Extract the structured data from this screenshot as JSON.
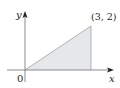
{
  "diagram": {
    "type": "shaded-triangle-region",
    "axes": {
      "x_label": "x",
      "y_label": "y",
      "origin_label": "0"
    },
    "vertices": [
      [
        0,
        0
      ],
      [
        3,
        0
      ],
      [
        3,
        2
      ]
    ],
    "point_label": "(3, 2)",
    "colors": {
      "fill": "#e6e7e8",
      "edge": "#a7a9ac",
      "axis": "#231f20"
    }
  }
}
